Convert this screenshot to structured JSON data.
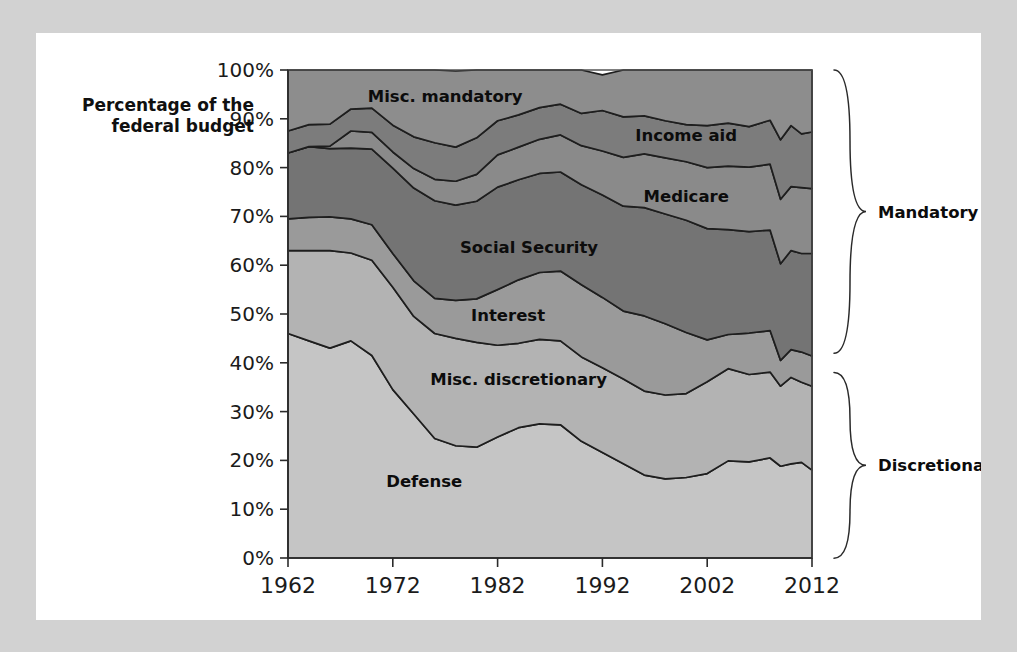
{
  "figure": {
    "axis_title_line1": "Percentage of the",
    "axis_title_line2": "federal budget"
  },
  "colors": {
    "page_background": "#d2d2d2",
    "card_background": "#ffffff",
    "misc_mandatory": "#8d8d8d",
    "income_aid": "#7c7c7c",
    "medicare": "#8a8a8a",
    "social_security": "#747474",
    "interest": "#9a9a9a",
    "misc_discretionary": "#b3b3b3",
    "defense": "#c5c5c5",
    "axis": "#2b2b2b",
    "label_text": "#0c0c0c"
  },
  "brackets": [
    {
      "id": "mandatory",
      "label": "Mandatory",
      "from_percent": 100,
      "to_percent": 42
    },
    {
      "id": "discretionary",
      "label": "Discretionary",
      "from_percent": 38,
      "to_percent": 0
    }
  ],
  "band_labels": [
    {
      "id": "misc-mandatory",
      "text": "Misc. mandatory",
      "year": 1977,
      "percent": 93.5
    },
    {
      "id": "income-aid",
      "text": "Income aid",
      "year": 2000,
      "percent": 85.5
    },
    {
      "id": "medicare",
      "text": "Medicare",
      "year": 2000,
      "percent": 73.0
    },
    {
      "id": "social-security",
      "text": "Social Security",
      "year": 1985,
      "percent": 62.5
    },
    {
      "id": "interest",
      "text": "Interest",
      "year": 1983,
      "percent": 48.5
    },
    {
      "id": "misc-discretionary",
      "text": "Misc. discretionary",
      "year": 1984,
      "percent": 35.5
    },
    {
      "id": "defense",
      "text": "Defense",
      "year": 1975,
      "percent": 14.5
    }
  ],
  "chart_data": {
    "type": "area",
    "stacked": true,
    "stack_order": "bottom-to-top",
    "title": "",
    "subtitle": "",
    "xlabel": "",
    "ylabel": "Percentage of the federal budget",
    "xlim": [
      1962,
      2012
    ],
    "ylim": [
      0,
      100
    ],
    "grid": false,
    "legend": "inline-labels",
    "xtick_labels": [
      "1962",
      "1972",
      "1982",
      "1992",
      "2002",
      "2012"
    ],
    "xticks": [
      1962,
      1972,
      1982,
      1992,
      2002,
      2012
    ],
    "ytick_labels": [
      "0%",
      "10%",
      "20%",
      "30%",
      "40%",
      "50%",
      "60%",
      "70%",
      "80%",
      "90%",
      "100%"
    ],
    "yticks": [
      0,
      10,
      20,
      30,
      40,
      50,
      60,
      70,
      80,
      90,
      100
    ],
    "x": [
      1962,
      1964,
      1966,
      1968,
      1970,
      1972,
      1974,
      1976,
      1978,
      1980,
      1982,
      1984,
      1986,
      1988,
      1990,
      1992,
      1994,
      1996,
      1998,
      2000,
      2002,
      2004,
      2006,
      2008,
      2009,
      2010,
      2011,
      2012
    ],
    "series": [
      {
        "name": "Defense",
        "id": "defense",
        "color": "#c5c5c5",
        "values": [
          46.0,
          44.5,
          43.0,
          44.5,
          41.5,
          34.5,
          29.5,
          24.5,
          23.0,
          22.7,
          24.8,
          26.7,
          27.5,
          27.3,
          23.9,
          21.6,
          19.3,
          17.0,
          16.2,
          16.5,
          17.3,
          19.9,
          19.7,
          20.5,
          18.8,
          19.3,
          19.6,
          18.0
        ]
      },
      {
        "name": "Misc. discretionary",
        "id": "misc-discretionary",
        "color": "#b3b3b3",
        "values": [
          17.0,
          18.5,
          20.0,
          18.0,
          19.5,
          21.0,
          20.0,
          21.5,
          22.0,
          21.5,
          18.8,
          17.3,
          17.3,
          17.2,
          17.3,
          17.4,
          17.4,
          17.2,
          17.2,
          17.2,
          18.8,
          18.9,
          17.9,
          17.6,
          16.4,
          17.7,
          16.4,
          17.2
        ]
      },
      {
        "name": "Interest",
        "id": "interest",
        "color": "#9a9a9a",
        "values": [
          6.5,
          6.8,
          6.9,
          7.0,
          7.3,
          6.9,
          7.3,
          7.2,
          7.8,
          8.9,
          11.4,
          13.0,
          13.7,
          14.3,
          14.8,
          14.4,
          13.9,
          15.4,
          14.6,
          12.5,
          8.6,
          7.0,
          8.5,
          8.5,
          5.3,
          5.7,
          6.2,
          6.2
        ]
      },
      {
        "name": "Social Security",
        "id": "social-security",
        "color": "#747474",
        "values": [
          13.5,
          14.5,
          14.0,
          14.5,
          15.5,
          17.5,
          19.0,
          20.0,
          19.5,
          20.0,
          21.0,
          20.5,
          20.3,
          20.3,
          20.5,
          21.0,
          21.5,
          22.2,
          22.5,
          23.0,
          22.8,
          21.5,
          20.8,
          20.6,
          19.8,
          20.3,
          20.2,
          21.0
        ]
      },
      {
        "name": "Medicare",
        "id": "medicare",
        "color": "#8a8a8a",
        "values": [
          0.0,
          0.0,
          0.5,
          3.5,
          3.4,
          3.3,
          4.0,
          4.4,
          4.9,
          5.5,
          6.6,
          6.7,
          7.0,
          7.6,
          8.0,
          9.0,
          10.0,
          11.0,
          11.5,
          12.0,
          12.5,
          13.0,
          13.2,
          13.5,
          13.2,
          13.1,
          13.5,
          13.3
        ]
      },
      {
        "name": "Income aid",
        "id": "income-aid",
        "color": "#7c7c7c",
        "values": [
          4.5,
          4.5,
          4.5,
          4.5,
          5.0,
          5.5,
          6.5,
          7.5,
          7.0,
          7.5,
          7.0,
          6.6,
          6.5,
          6.3,
          6.6,
          8.3,
          8.3,
          7.8,
          7.6,
          7.6,
          8.6,
          8.8,
          8.3,
          9.0,
          12.2,
          12.5,
          11.0,
          11.6
        ]
      },
      {
        "name": "Misc. mandatory",
        "id": "misc-mandatory",
        "color": "#8d8d8d",
        "values": [
          12.5,
          11.2,
          11.1,
          8.0,
          7.8,
          11.3,
          13.7,
          14.9,
          15.6,
          13.9,
          10.4,
          9.2,
          7.7,
          7.0,
          8.9,
          7.3,
          9.6,
          9.4,
          10.4,
          11.2,
          11.4,
          10.9,
          11.6,
          10.3,
          14.3,
          11.4,
          13.1,
          12.7
        ]
      }
    ]
  }
}
